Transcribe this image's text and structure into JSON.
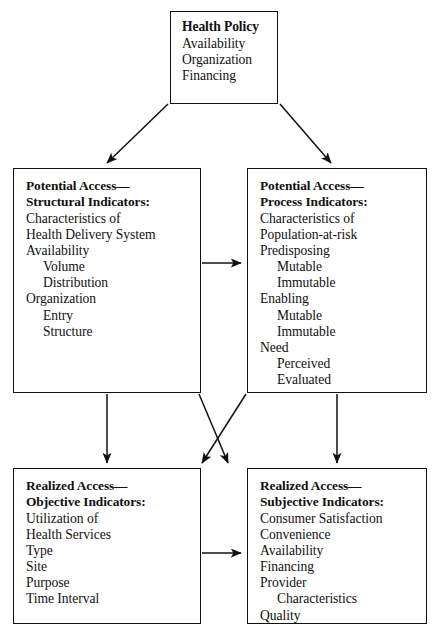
{
  "diagram": {
    "type": "flow-diagram",
    "boxes": [
      {
        "id": "health-policy",
        "title": "Health Policy",
        "lines": [
          "Availability",
          "Organization",
          "Financing"
        ],
        "indents": [
          0,
          0,
          0
        ]
      },
      {
        "id": "potential-structural",
        "title": "Potential Access—\nStructural Indicators:",
        "lines": [
          "Characteristics of",
          "Health Delivery System",
          "Availability",
          "Volume",
          "Distribution",
          "Organization",
          "Entry",
          "Structure"
        ],
        "indents": [
          0,
          0,
          0,
          1,
          1,
          0,
          1,
          1
        ]
      },
      {
        "id": "potential-process",
        "title": "Potential Access—\nProcess Indicators:",
        "lines": [
          "Characteristics of",
          "Population-at-risk",
          "Predisposing",
          "Mutable",
          "Immutable",
          "Enabling",
          "Mutable",
          "Immutable",
          "Need",
          "Perceived",
          "Evaluated"
        ],
        "indents": [
          0,
          0,
          0,
          1,
          1,
          0,
          1,
          1,
          0,
          1,
          1
        ]
      },
      {
        "id": "realized-objective",
        "title": "Realized Access—\nObjective Indicators:",
        "lines": [
          "Utilization of",
          "Health Services",
          "Type",
          "Site",
          "Purpose",
          "Time Interval"
        ],
        "indents": [
          0,
          0,
          0,
          0,
          0,
          0
        ]
      },
      {
        "id": "realized-subjective",
        "title": "Realized Access—\nSubjective Indicators:",
        "lines": [
          "Consumer Satisfaction",
          "Convenience",
          "Availability",
          "Financing",
          "Provider",
          "Characteristics",
          "Quality"
        ],
        "indents": [
          0,
          0,
          0,
          0,
          0,
          1,
          0
        ]
      }
    ],
    "connectors": [
      {
        "name": "health-policy-to-potential-structural",
        "from": "health-policy",
        "to": "potential-structural",
        "style": "diagonal-arrow"
      },
      {
        "name": "health-policy-to-potential-process",
        "from": "health-policy",
        "to": "potential-process",
        "style": "diagonal-arrow"
      },
      {
        "name": "potential-structural-to-potential-process",
        "from": "potential-structural",
        "to": "potential-process",
        "style": "horizontal-arrow"
      },
      {
        "name": "potential-structural-to-realized-objective",
        "from": "potential-structural",
        "to": "realized-objective",
        "style": "vertical-arrow"
      },
      {
        "name": "potential-process-to-realized-subjective",
        "from": "potential-process",
        "to": "realized-subjective",
        "style": "vertical-arrow"
      },
      {
        "name": "potential-structural-to-realized-subjective",
        "from": "potential-structural",
        "to": "realized-subjective",
        "style": "crossing-diagonal-arrow"
      },
      {
        "name": "potential-process-to-realized-objective",
        "from": "potential-process",
        "to": "realized-objective",
        "style": "crossing-diagonal-arrow"
      },
      {
        "name": "realized-objective-to-realized-subjective",
        "from": "realized-objective",
        "to": "realized-subjective",
        "style": "horizontal-arrow"
      }
    ],
    "colors": {
      "stroke": "#111111",
      "background": "#ffffff"
    }
  }
}
